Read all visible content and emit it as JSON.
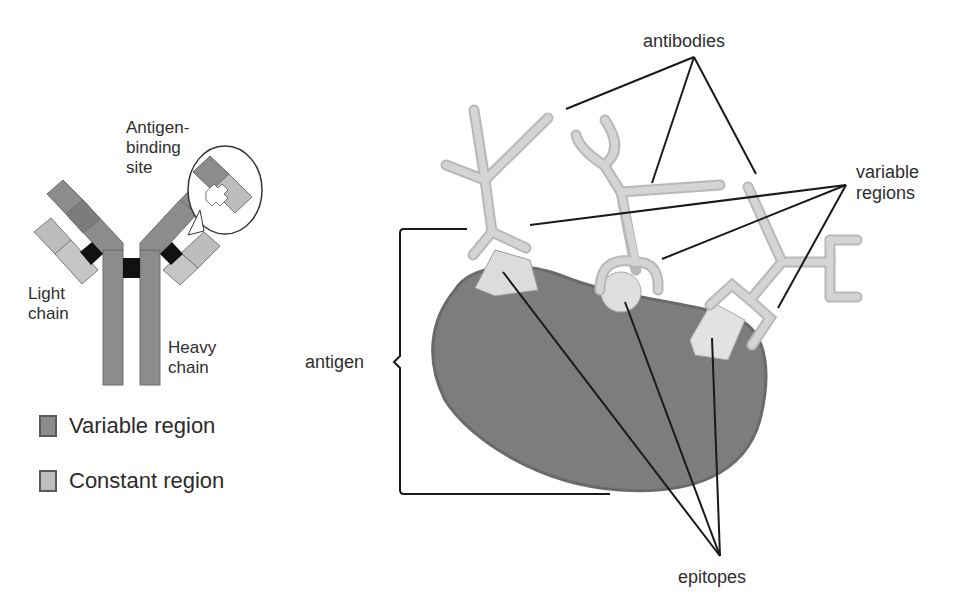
{
  "diagram": {
    "left_panel": {
      "labels": {
        "antigen_binding_site_line1": "Antigen-",
        "antigen_binding_site_line2": "binding",
        "antigen_binding_site_line3": "site",
        "light_chain_line1": "Light",
        "light_chain_line2": "chain",
        "heavy_chain_line1": "Heavy",
        "heavy_chain_line2": "chain"
      },
      "legend": [
        {
          "label": "Variable region",
          "color": "#8c8c8c"
        },
        {
          "label": "Constant region",
          "color": "#bdbdbd"
        }
      ]
    },
    "right_panel": {
      "labels": {
        "antibodies": "antibodies",
        "variable_regions_line1": "variable",
        "variable_regions_line2": "regions",
        "antigen": "antigen",
        "epitopes": "epitopes"
      }
    },
    "colors": {
      "variable_region": "#8c8c8c",
      "constant_region": "#bdbdbd",
      "disulfide_bond": "#111111",
      "antibody_fill": "#cfcfcf",
      "antigen_fill": "#7d7d7d",
      "epitope_fill": "#dcdcdc",
      "leader_line": "#1a1a1a"
    }
  }
}
